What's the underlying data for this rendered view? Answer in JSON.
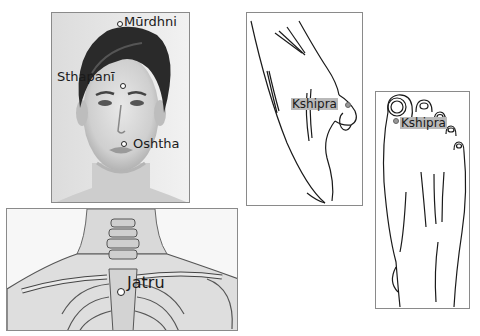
{
  "panels": {
    "face": {
      "labels": {
        "murdhni": "Mūrdhni",
        "sthapani": "Sthapanī",
        "oshtha": "Oshtha"
      }
    },
    "chest": {
      "labels": {
        "jatru": "Jatru"
      }
    },
    "hand": {
      "labels": {
        "kshipra": "Kshipra"
      }
    },
    "foot": {
      "labels": {
        "kshipra": "Kshipra"
      }
    }
  },
  "colors": {
    "border": "#8a8a8a",
    "label_highlight": "#b9b9b9",
    "line_art": "#1a1a1a"
  }
}
